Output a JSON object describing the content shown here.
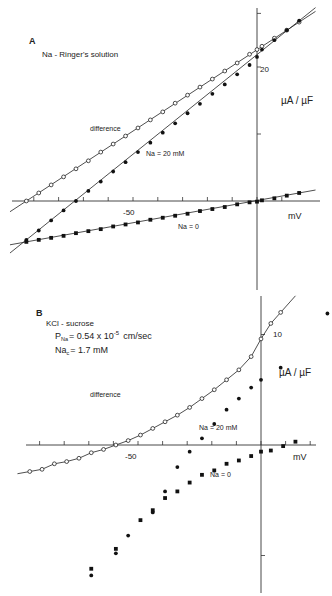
{
  "chart_data": [
    {
      "type": "scatter",
      "panel": "A",
      "title": "Na - Ringer's solution",
      "xlabel": "mV",
      "ylabel": "µA / µF",
      "xlim": [
        -95,
        20
      ],
      "ylim": [
        -8,
        30
      ],
      "x_ticks": [
        -90,
        -80,
        -70,
        -60,
        -50,
        -40,
        -30,
        -20,
        -10,
        0,
        10
      ],
      "x_tick_labels": [
        {
          "value": -50,
          "label": "-50"
        }
      ],
      "y_ticks": [
        0,
        10,
        20,
        28
      ],
      "y_tick_labels": [
        {
          "value": 20,
          "label": "20"
        }
      ],
      "grid": false,
      "annotations": [
        "difference",
        "Na = 20 mM",
        "Na = 0"
      ],
      "series": [
        {
          "name": "difference",
          "marker": "open-circle",
          "fit": "line",
          "x": [
            -93,
            -88,
            -83,
            -78,
            -73,
            -68,
            -63,
            -58,
            -53,
            -48,
            -43,
            -38,
            -33,
            -28,
            -23,
            -18,
            -13,
            -8,
            -3,
            0,
            2,
            7,
            12,
            17
          ],
          "y": [
            0.0,
            1.2,
            2.4,
            3.6,
            4.8,
            6.0,
            7.3,
            8.5,
            9.7,
            10.9,
            12.1,
            13.3,
            14.6,
            15.8,
            17.0,
            18.2,
            19.4,
            20.6,
            21.9,
            22.6,
            23.1,
            24.3,
            25.5,
            26.7
          ]
        },
        {
          "name": "Na = 20 mM",
          "marker": "filled-circle",
          "fit": "line",
          "x": [
            -93,
            -88,
            -83,
            -78,
            -73,
            -68,
            -63,
            -58,
            -53,
            -48,
            -43,
            -38,
            -33,
            -28,
            -23,
            -18,
            -13,
            -8,
            -3,
            0,
            2,
            7,
            12,
            17
          ],
          "y": [
            -5.8,
            -4.4,
            -2.9,
            -1.4,
            0.0,
            1.5,
            2.9,
            4.4,
            5.8,
            7.3,
            8.7,
            10.2,
            11.6,
            13.1,
            14.5,
            16.0,
            17.4,
            18.9,
            20.3,
            21.5,
            22.6,
            24.0,
            25.5,
            26.9
          ]
        },
        {
          "name": "Na = 0",
          "marker": "filled-square",
          "fit": "line",
          "x": [
            -93,
            -88,
            -83,
            -78,
            -73,
            -68,
            -63,
            -58,
            -53,
            -48,
            -43,
            -38,
            -33,
            -28,
            -23,
            -18,
            -13,
            -8,
            -3,
            0,
            2,
            7,
            12,
            17
          ],
          "y": [
            -6.1,
            -5.8,
            -5.5,
            -5.2,
            -4.8,
            -4.5,
            -4.2,
            -3.8,
            -3.5,
            -3.2,
            -2.8,
            -2.5,
            -2.2,
            -1.9,
            -1.5,
            -1.2,
            -0.9,
            -0.5,
            -0.2,
            -0.1,
            0.1,
            0.4,
            0.8,
            1.2
          ]
        }
      ]
    },
    {
      "type": "scatter",
      "panel": "B",
      "title": "KCl - sucrose",
      "subtitle_lines": [
        "P_Na = 0.54 x 10^-5 cm/sec",
        "Na_c = 1.7 mM"
      ],
      "xlabel": "mV",
      "ylabel": "µA / µF",
      "xlim": [
        -95,
        20
      ],
      "ylim": [
        -13,
        13
      ],
      "x_ticks": [
        -90,
        -80,
        -70,
        -60,
        -50,
        -40,
        -30,
        -20,
        -10,
        0,
        10,
        20
      ],
      "x_tick_labels": [
        {
          "value": -50,
          "label": "-50"
        }
      ],
      "y_ticks": [
        -10,
        10
      ],
      "y_tick_labels": [
        {
          "value": 10,
          "label": "10"
        }
      ],
      "grid": false,
      "annotations": [
        "difference",
        "Na = 20 mM",
        "Na = 0"
      ],
      "series": [
        {
          "name": "difference",
          "marker": "open-circle",
          "fit": "curve",
          "x": [
            -94,
            -89,
            -84,
            -79,
            -74,
            -69,
            -64,
            -59,
            -54,
            -49,
            -44,
            -39,
            -34,
            -29,
            -24,
            -19,
            -14,
            -9,
            -4,
            0,
            4,
            8
          ],
          "y": [
            -2.4,
            -2.2,
            -1.7,
            -1.5,
            -1.2,
            -0.7,
            -0.4,
            0.0,
            0.4,
            0.9,
            1.5,
            2.1,
            2.7,
            3.4,
            4.2,
            5.0,
            5.9,
            6.8,
            8.0,
            9.6,
            11.0,
            12.0
          ]
        },
        {
          "name": "Na = 20 mM",
          "marker": "filled-circle",
          "fit": "none",
          "x": [
            -69,
            -59,
            -54,
            -44,
            -39,
            -34,
            -29,
            -24,
            -19,
            -14,
            -9,
            -4,
            0,
            8,
            27
          ],
          "y": [
            -11.8,
            -9.8,
            -8.2,
            -6.1,
            -4.2,
            -2.0,
            -0.6,
            0.6,
            1.9,
            3.2,
            4.2,
            5.2,
            5.9,
            7.0,
            11.9
          ]
        },
        {
          "name": "Na = 0",
          "marker": "filled-square",
          "fit": "none",
          "x": [
            -69,
            -59,
            -49,
            -44,
            -39,
            -34,
            -29,
            -24,
            -19,
            -14,
            -9,
            -4,
            0,
            4,
            9,
            14
          ],
          "y": [
            -11.2,
            -9.4,
            -6.8,
            -5.9,
            -4.8,
            -4.2,
            -3.4,
            -2.7,
            -2.3,
            -1.7,
            -1.4,
            -1.0,
            -0.6,
            -0.5,
            -0.1,
            0.3
          ]
        }
      ]
    }
  ],
  "labels": {
    "panelA": {
      "letter": "A",
      "title": "Na - Ringer's solution",
      "xunit": "mV",
      "yunit": "µA / µF",
      "xtick": "-50",
      "ytick": "20",
      "diff": "difference",
      "na20": "Na = 20 mM",
      "na0": "Na = 0"
    },
    "panelB": {
      "letter": "B",
      "title": "KCl - sucrose",
      "pna_prefix": "P",
      "pna_sub": "Na",
      "pna_value": "= 0.54 x 10",
      "pna_exp": "-5",
      "pna_unit": "cm/sec",
      "nac_prefix": "Na",
      "nac_sub": "c",
      "nac_value": "= 1.7  mM",
      "xunit": "mV",
      "yunit": "µA / µF",
      "xtick": "-50",
      "ytick": "10",
      "diff": "difference",
      "na20": "Na = 20 mM",
      "na0": "Na = 0"
    }
  }
}
